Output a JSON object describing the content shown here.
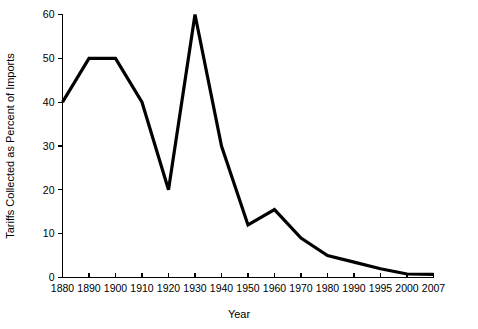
{
  "chart_data": {
    "type": "line",
    "title": "",
    "xlabel": "Year",
    "ylabel": "Tariffs Collected as Percent of Imports",
    "categories": [
      "1880",
      "1890",
      "1900",
      "1910",
      "1920",
      "1930",
      "1940",
      "1950",
      "1960",
      "1970",
      "1980",
      "1990",
      "1995",
      "2000",
      "2007"
    ],
    "values": [
      40,
      50,
      50,
      40,
      20,
      60,
      30,
      12,
      15.5,
      9,
      5,
      3.5,
      2,
      0.8,
      0.7
    ],
    "series": [
      {
        "name": "Tariffs Collected as Percent of Imports",
        "values": [
          40,
          50,
          50,
          40,
          20,
          60,
          30,
          12,
          15.5,
          9,
          5,
          3.5,
          2,
          0.8,
          0.7
        ]
      }
    ],
    "ylim": [
      0,
      60
    ],
    "yticks": [
      0,
      10,
      20,
      30,
      40,
      50,
      60
    ],
    "ytick_labels": [
      "0",
      "10",
      "20",
      "30",
      "40",
      "50",
      "60"
    ],
    "grid": false,
    "legend": "none",
    "line_color": "#000000"
  },
  "axes": {
    "x_title": "Year",
    "y_title": "Tariffs Collected as Percent of Imports"
  }
}
